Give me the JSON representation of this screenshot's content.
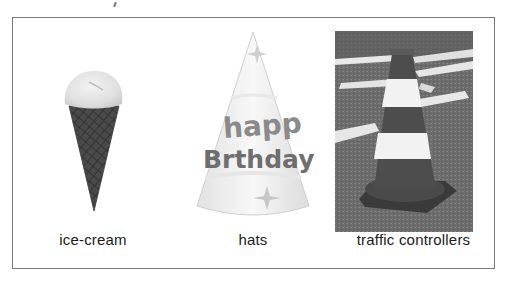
{
  "figure": {
    "items": [
      {
        "label": "ice-cream",
        "image": "ice-cream-cone-photo"
      },
      {
        "label": "hats",
        "image": "party-hat-photo",
        "hat_text": [
          "happy",
          "Birthday"
        ]
      },
      {
        "label": "traffic controllers",
        "image": "traffic-cone-photo"
      }
    ]
  }
}
